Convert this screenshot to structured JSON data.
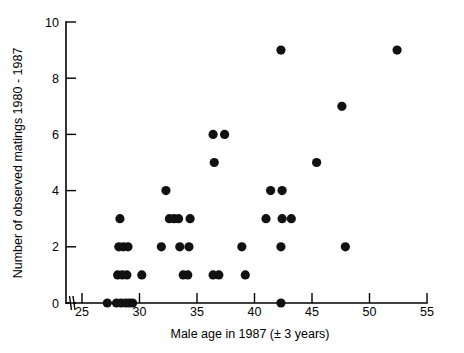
{
  "chart_data": {
    "type": "scatter",
    "title": "",
    "xlabel": "Male age in 1987 (± 3 years)",
    "ylabel": "Number of observed matings 1980 - 1987",
    "xlim": [
      25,
      55
    ],
    "ylim": [
      0,
      10
    ],
    "xticks": [
      25,
      30,
      35,
      40,
      45,
      50,
      55
    ],
    "xticklabels": [
      "25",
      "30",
      "35",
      "40",
      "45",
      "50",
      "55"
    ],
    "yticks": [
      0,
      2,
      4,
      6,
      8,
      10
    ],
    "yticklabels": [
      "0",
      "2",
      "4",
      "6",
      "8",
      "10"
    ],
    "grid": false,
    "legend": null,
    "axis_break_x": true,
    "marker": "filled-circle",
    "marker_color": "#111111",
    "marker_size_px": 4.6,
    "points": [
      {
        "x": 27.2,
        "y": 0
      },
      {
        "x": 28.0,
        "y": 0
      },
      {
        "x": 28.4,
        "y": 0
      },
      {
        "x": 28.8,
        "y": 0
      },
      {
        "x": 29.1,
        "y": 0
      },
      {
        "x": 29.4,
        "y": 0
      },
      {
        "x": 42.3,
        "y": 0
      },
      {
        "x": 28.1,
        "y": 1
      },
      {
        "x": 28.5,
        "y": 1
      },
      {
        "x": 28.9,
        "y": 1
      },
      {
        "x": 30.2,
        "y": 1
      },
      {
        "x": 33.8,
        "y": 1
      },
      {
        "x": 34.2,
        "y": 1
      },
      {
        "x": 36.4,
        "y": 1
      },
      {
        "x": 36.9,
        "y": 1
      },
      {
        "x": 39.2,
        "y": 1
      },
      {
        "x": 28.2,
        "y": 2
      },
      {
        "x": 28.6,
        "y": 2
      },
      {
        "x": 29.0,
        "y": 2
      },
      {
        "x": 31.9,
        "y": 2
      },
      {
        "x": 33.5,
        "y": 2
      },
      {
        "x": 34.3,
        "y": 2
      },
      {
        "x": 38.9,
        "y": 2
      },
      {
        "x": 42.3,
        "y": 2
      },
      {
        "x": 47.9,
        "y": 2
      },
      {
        "x": 28.3,
        "y": 3
      },
      {
        "x": 32.6,
        "y": 3
      },
      {
        "x": 33.0,
        "y": 3
      },
      {
        "x": 33.4,
        "y": 3
      },
      {
        "x": 34.4,
        "y": 3
      },
      {
        "x": 41.0,
        "y": 3
      },
      {
        "x": 42.4,
        "y": 3
      },
      {
        "x": 43.2,
        "y": 3
      },
      {
        "x": 32.3,
        "y": 4
      },
      {
        "x": 41.4,
        "y": 4
      },
      {
        "x": 42.4,
        "y": 4
      },
      {
        "x": 36.5,
        "y": 5
      },
      {
        "x": 45.4,
        "y": 5
      },
      {
        "x": 36.4,
        "y": 6
      },
      {
        "x": 37.4,
        "y": 6
      },
      {
        "x": 47.6,
        "y": 7
      },
      {
        "x": 42.3,
        "y": 9
      },
      {
        "x": 52.4,
        "y": 9
      }
    ]
  }
}
